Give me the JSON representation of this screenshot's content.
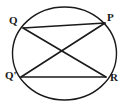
{
  "figure": {
    "type": "geometry-diagram",
    "background_color": "#ffffff",
    "stroke_color": "#1a1a1a",
    "label_color": "#1a1a1a",
    "canvas": {
      "width": 129,
      "height": 106
    },
    "circle": {
      "name": "circumscribed-circle",
      "center_x": 64.5,
      "center_y": 53.5,
      "radius_x": 52,
      "radius_y": 46.5,
      "stroke_width": 1.4,
      "fill": "none"
    },
    "points": [
      {
        "id": "Q",
        "label": "Q",
        "x": 23,
        "y": 28,
        "label_x": 9,
        "label_y": 15
      },
      {
        "id": "P",
        "label": "P",
        "x": 105,
        "y": 23,
        "label_x": 107,
        "label_y": 12
      },
      {
        "id": "Qp",
        "label": "Q'",
        "x": 21,
        "y": 77,
        "label_x": 5,
        "label_y": 70
      },
      {
        "id": "R",
        "label": "R",
        "x": 106,
        "y": 77,
        "label_x": 110,
        "label_y": 72
      }
    ],
    "chords": [
      {
        "id": "chord-QP",
        "from": "Q",
        "to": "P",
        "x1": 23,
        "y1": 28,
        "x2": 105,
        "y2": 23,
        "stroke_width": 1.4
      },
      {
        "id": "chord-QpR",
        "from": "Qp",
        "to": "R",
        "x1": 21,
        "y1": 77,
        "x2": 106,
        "y2": 77,
        "stroke_width": 1.4
      },
      {
        "id": "chord-QR",
        "from": "Q",
        "to": "R",
        "x1": 23,
        "y1": 28,
        "x2": 106,
        "y2": 77,
        "stroke_width": 1.6
      },
      {
        "id": "chord-QpP",
        "from": "Qp",
        "to": "P",
        "x1": 21,
        "y1": 77,
        "x2": 105,
        "y2": 23,
        "stroke_width": 1.6
      }
    ],
    "intersection": {
      "id": "diagonal-crossing",
      "x": 64,
      "y": 52
    }
  }
}
